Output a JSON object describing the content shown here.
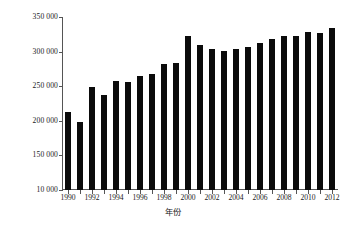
{
  "chart_data": {
    "type": "bar",
    "title": "",
    "subtitle": "",
    "xlabel": "年份",
    "ylabel": "与生物多样性有关的词条/条",
    "categories": [
      "1990",
      "1991",
      "1992",
      "1993",
      "1994",
      "1995",
      "1996",
      "1997",
      "1998",
      "1999",
      "2000",
      "2001",
      "2002",
      "2003",
      "2004",
      "2005",
      "2006",
      "2007",
      "2008",
      "2009",
      "2010",
      "2011",
      "2012"
    ],
    "values": [
      213000,
      199000,
      249000,
      237000,
      258000,
      256000,
      265000,
      268000,
      282000,
      283000,
      322000,
      309000,
      304000,
      301000,
      304000,
      307000,
      312000,
      318000,
      322000,
      323000,
      329000,
      327000,
      334000
    ],
    "series": [
      {
        "name": "与生物多样性有关的词条",
        "values": [
          213000,
          199000,
          249000,
          237000,
          258000,
          256000,
          265000,
          268000,
          282000,
          283000,
          322000,
          309000,
          304000,
          301000,
          304000,
          307000,
          312000,
          318000,
          322000,
          323000,
          329000,
          327000,
          334000
        ]
      }
    ],
    "ylim": [
      100000,
      350000
    ],
    "ytick_values": [
      350000,
      300000,
      250000,
      200000,
      150000,
      100000
    ],
    "ytick_labels": [
      "350 000",
      "300 000",
      "250 000",
      "200 000",
      "150 000",
      "10 000"
    ],
    "xtick_labels": [
      "1990",
      "1992",
      "1994",
      "1996",
      "1998",
      "2000",
      "2002",
      "2004",
      "2006",
      "2008",
      "2010",
      "2012"
    ],
    "grid": false,
    "legend": false,
    "legend_position": "none",
    "bar_color": "#0b0b0b",
    "axis_color": "#555555",
    "background_color": "#ffffff"
  }
}
